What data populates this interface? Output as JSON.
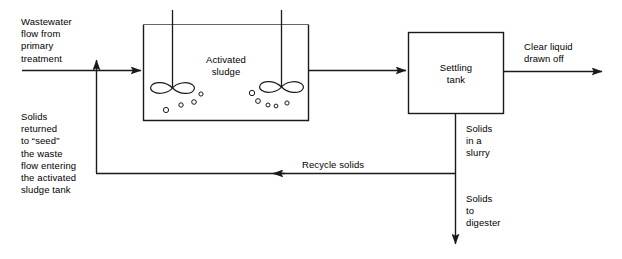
{
  "diagram": {
    "colors": {
      "line": "#1a1a1a",
      "text": "#000000",
      "background": "#ffffff"
    },
    "labels": {
      "inlet": "Wastewater\nflow from\nprimary\ntreatment",
      "return": "Solids\nreturned\nto “seed”\nthe waste\nflow entering\nthe activated\nsludge tank",
      "aeration_tank": "Activated\nsludge",
      "settling_tank": "Settling\ntank",
      "clear_effluent": "Clear liquid\ndrawn off",
      "slurry": "Solids\nin a\nslurry",
      "recycle": "Recycle solids",
      "digester": "Solids\nto\ndigester"
    },
    "nodes": [
      {
        "id": "aeration-tank",
        "label": "Activated sludge",
        "shape": "open-top-tank"
      },
      {
        "id": "settling-tank",
        "label": "Settling tank",
        "shape": "rectangle"
      }
    ],
    "flows": [
      {
        "id": "influent-flow",
        "label": "Wastewater flow from primary treatment",
        "direction": "right",
        "to": "aeration-tank"
      },
      {
        "id": "return-sludge-riser",
        "label": "Solids returned to “seed” the waste flow entering the activated sludge tank",
        "direction": "up"
      },
      {
        "id": "aeration-to-settling",
        "label": "",
        "direction": "right",
        "from": "aeration-tank",
        "to": "settling-tank"
      },
      {
        "id": "clear-liquid-flow",
        "label": "Clear liquid drawn off",
        "direction": "right",
        "from": "settling-tank"
      },
      {
        "id": "solids-slurry-flow",
        "label": "Solids in a slurry",
        "direction": "down",
        "from": "settling-tank"
      },
      {
        "id": "recycle-solids-flow",
        "label": "Recycle solids",
        "direction": "left"
      },
      {
        "id": "solids-to-digester-flow",
        "label": "Solids to digester",
        "direction": "down"
      }
    ],
    "equipment": [
      {
        "id": "aerator-left",
        "type": "surface-aerator-impeller"
      },
      {
        "id": "aerator-right",
        "type": "surface-aerator-impeller"
      }
    ]
  }
}
